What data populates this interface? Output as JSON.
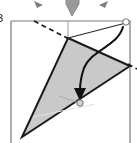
{
  "figure": {
    "type": "origami-fold-diagram",
    "canvas": {
      "width": 137,
      "height": 143
    },
    "background_color": "#ffffff",
    "stroke_color": "#1a1a1a",
    "shade_color": "#c9c9c9",
    "paper_outline_color": "#7a7a7a",
    "guide_color": "#cfcfcf",
    "clipped_label": "B"
  },
  "paper_sheet": {
    "name": "paper-rectangle",
    "points": "11,21 130,21 130,138 11,138",
    "top_edge_y": 21,
    "left_edge_x": 11,
    "right_edge_x": 130
  },
  "folded_flap": {
    "name": "shaded-triangle",
    "points": "68,38 130,66 22,137",
    "fill": "#c9c9c9",
    "vertices": [
      {
        "label": "apex-top",
        "x": 68,
        "y": 38
      },
      {
        "label": "right-corner",
        "x": 130,
        "y": 66
      },
      {
        "label": "bottom-left",
        "x": 22,
        "y": 137
      }
    ]
  },
  "fold_lines": [
    {
      "name": "dashed-crease-upper-left",
      "x1": 36,
      "y1": 22,
      "x2": 68,
      "y2": 38,
      "style": "dashed"
    },
    {
      "name": "dashed-crease-right",
      "x1": 130,
      "y1": 66,
      "x2": 137,
      "y2": 69,
      "style": "dashed"
    },
    {
      "name": "vertical-guide",
      "x1": 68,
      "y1": 21,
      "x2": 68,
      "y2": 38,
      "style": "thin-solid"
    },
    {
      "name": "guide-line-interior",
      "x1": 33,
      "y1": 116,
      "x2": 92,
      "y2": 104,
      "style": "light"
    },
    {
      "name": "guide-tick-lower",
      "x1": 60,
      "y1": 97,
      "x2": 79,
      "y2": 104,
      "style": "light"
    }
  ],
  "connector_edges": [
    {
      "name": "edge-apex-to-top-right",
      "x1": 68,
      "y1": 38,
      "x2": 126,
      "y2": 22
    }
  ],
  "motion_arrow": {
    "name": "fold-motion-arrow",
    "path": "M 124,26 C 118,46 92,48 84,68 C 80,79 80,88 80,92",
    "arrowhead_tip": {
      "x": 80,
      "y": 99
    },
    "direction": "down",
    "stroke": "#111111"
  },
  "markers": [
    {
      "name": "reference-point-top-right",
      "x": 126,
      "y": 22,
      "r": 3,
      "fill": "#ffffff",
      "stroke": "#6e6e6e"
    },
    {
      "name": "reference-point-target",
      "x": 80,
      "y": 102,
      "r": 3,
      "fill": "#d2d2d2",
      "stroke": "#6e6e6e"
    }
  ],
  "clipped_arrows_top": [
    {
      "name": "clipped-arrow-left",
      "points": "36,0 41,4 38,7",
      "note": "partial glyph from figure above"
    },
    {
      "name": "clipped-arrow-center-down",
      "points": "67,0 78,0 72,16",
      "note": "downward arrowhead"
    },
    {
      "name": "clipped-arrow-right",
      "points": "100,2 106,0 104,6",
      "note": "partial glyph from figure above"
    }
  ]
}
